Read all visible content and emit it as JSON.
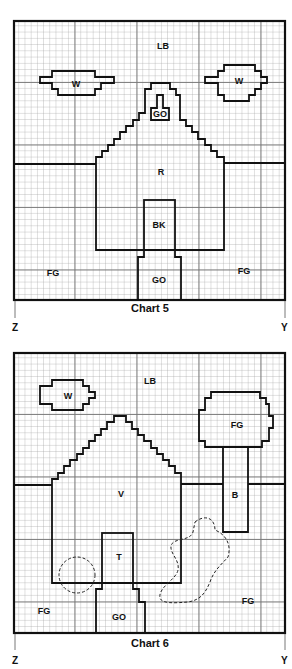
{
  "charts": [
    {
      "caption": "Chart 5",
      "corner_left": "Z",
      "corner_right": "Y",
      "regions": {
        "sky": "LB",
        "cloud_left": "W",
        "cloud_right": "W",
        "chimney_window": "GO",
        "house": "R",
        "door": "BK",
        "path": "GO",
        "ground_left": "FG",
        "ground_right": "FG"
      }
    },
    {
      "caption": "Chart 6",
      "corner_left": "Z",
      "corner_right": "Y",
      "regions": {
        "sky": "LB",
        "cloud": "W",
        "tree_top": "FG",
        "tree_trunk": "B",
        "house": "V",
        "door": "T",
        "path": "GO",
        "ground_left": "FG",
        "ground_right": "FG"
      }
    }
  ],
  "legend_note": "Grid charts with color-code letters: LB, W, GO, R, BK, FG, V, T, B"
}
